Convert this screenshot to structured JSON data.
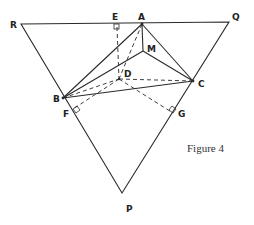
{
  "figure": {
    "caption": "Figure 4",
    "points": {
      "R": {
        "label": "R",
        "x": 21,
        "y": 24
      },
      "Q": {
        "label": "Q",
        "x": 229,
        "y": 22
      },
      "P": {
        "label": "P",
        "x": 122,
        "y": 193
      },
      "A": {
        "label": "A",
        "x": 142,
        "y": 24
      },
      "E": {
        "label": "E",
        "x": 117,
        "y": 24
      },
      "M": {
        "label": "M",
        "x": 143,
        "y": 51
      },
      "D": {
        "label": "D",
        "x": 119,
        "y": 79
      },
      "C": {
        "label": "C",
        "x": 193,
        "y": 81
      },
      "B": {
        "label": "B",
        "x": 63,
        "y": 98
      },
      "F": {
        "label": "F",
        "x": 73,
        "y": 109
      },
      "G": {
        "label": "G",
        "x": 173,
        "y": 113
      }
    },
    "solid_segments": [
      "RQ",
      "QP",
      "PR",
      "AB",
      "AC",
      "AM",
      "MB",
      "MC",
      "BC"
    ],
    "dashed_segments": [
      "ED",
      "AD",
      "BD",
      "DC",
      "DF",
      "DG"
    ],
    "right_angle_marks": [
      "E",
      "F",
      "G"
    ],
    "colors": {
      "line": "#2a2a2a",
      "background": "#ffffff"
    }
  }
}
